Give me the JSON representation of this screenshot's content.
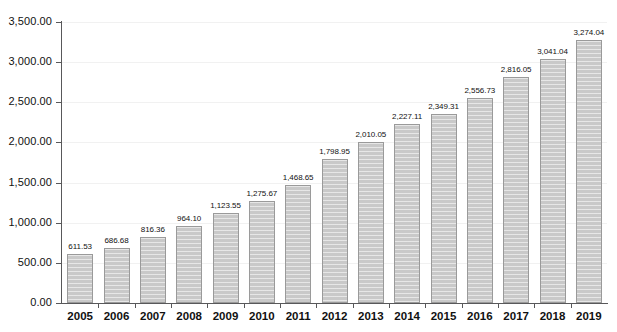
{
  "chart_data": {
    "type": "bar",
    "title": "",
    "subtitle": "",
    "xlabel": "",
    "ylabel": "",
    "legend": [],
    "grid": true,
    "ylim": [
      0,
      3500
    ],
    "ytick_step": 500,
    "categories": [
      "2005",
      "2006",
      "2007",
      "2008",
      "2009",
      "2010",
      "2011",
      "2012",
      "2013",
      "2014",
      "2015",
      "2016",
      "2017",
      "2018",
      "2019"
    ],
    "values": [
      611.53,
      686.68,
      816.36,
      964.1,
      1123.55,
      1275.67,
      1468.65,
      1798.95,
      2010.05,
      2227.11,
      2349.31,
      2556.73,
      2816.05,
      3041.04,
      3274.04
    ],
    "value_labels": [
      "611.53",
      "686.68",
      "816.36",
      "964.10",
      "1,123.55",
      "1,275.67",
      "1,468.65",
      "1,798.95",
      "2,010.05",
      "2,227.11",
      "2,349.31",
      "2,556.73",
      "2,816.05",
      "3,041.04",
      "3,274.04"
    ],
    "ytick_labels": [
      "3,500.00",
      "3,000.00",
      "2,500.00",
      "2,000.00",
      "1,500.00",
      "1,000.00",
      "500.00",
      "0.00"
    ],
    "ytick_values": [
      3500,
      3000,
      2500,
      2000,
      1500,
      1000,
      500,
      0
    ],
    "series": [
      {
        "name": "",
        "values": [
          611.53,
          686.68,
          816.36,
          964.1,
          1123.55,
          1275.67,
          1468.65,
          1798.95,
          2010.05,
          2227.11,
          2349.31,
          2556.73,
          2816.05,
          3041.04,
          3274.04
        ]
      }
    ],
    "colors": {
      "bar_fill": "#c9c9c9",
      "bar_border": "#9a9a9a",
      "axis": "#58585a",
      "gridline": "#f1f1f1",
      "text": "#111111",
      "background": "#ffffff"
    }
  }
}
